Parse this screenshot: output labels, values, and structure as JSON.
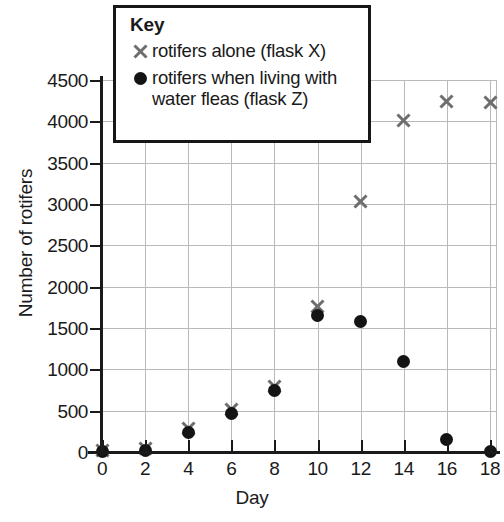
{
  "chart_data": {
    "type": "scatter",
    "title": "",
    "xlabel": "Day",
    "ylabel": "Number of rotifers",
    "xlim": [
      0,
      18
    ],
    "ylim": [
      0,
      4500
    ],
    "grid": true,
    "legend_position": "top-center",
    "x_ticks": [
      0,
      2,
      4,
      6,
      8,
      10,
      12,
      14,
      16,
      18
    ],
    "y_ticks": [
      0,
      500,
      1000,
      1500,
      2000,
      2500,
      3000,
      3500,
      4000,
      4500
    ],
    "x": [
      0,
      2,
      4,
      6,
      8,
      10,
      12,
      14,
      16,
      18
    ],
    "series": [
      {
        "name": "rotifers alone (flask X)",
        "marker": "cross",
        "color": "#6e6e6e",
        "x": [
          0,
          2,
          4,
          6,
          8,
          10,
          12,
          14,
          16,
          18
        ],
        "values": [
          20,
          40,
          280,
          520,
          790,
          1760,
          3030,
          4010,
          4240,
          4230
        ]
      },
      {
        "name": "rotifers when living with water fleas (flask Z)",
        "marker": "dot",
        "color": "#141414",
        "x": [
          0,
          2,
          4,
          6,
          8,
          10,
          12,
          14,
          16,
          18
        ],
        "values": [
          10,
          20,
          230,
          465,
          750,
          1650,
          1580,
          1100,
          150,
          10
        ]
      }
    ]
  },
  "legend": {
    "title": "Key",
    "entries": [
      {
        "marker": "cross-marker",
        "label": "rotifers alone (flask X)"
      },
      {
        "marker": "dot-marker",
        "label": "rotifers when living with\nwater fleas (flask Z)"
      }
    ]
  },
  "axes": {
    "x_title": "Day",
    "y_title": "Number of rotifers"
  }
}
